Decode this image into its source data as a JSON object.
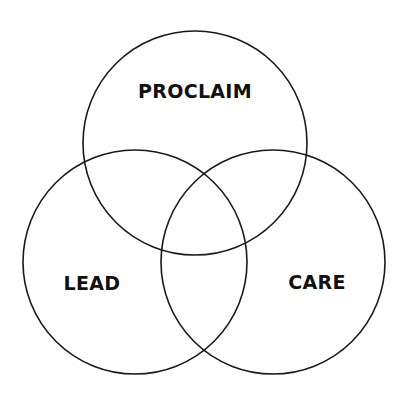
{
  "diagram": {
    "type": "venn",
    "sets": [
      {
        "id": "proclaim",
        "label": "PROCLAIM"
      },
      {
        "id": "lead",
        "label": "LEAD"
      },
      {
        "id": "care",
        "label": "CARE"
      }
    ],
    "stroke_color": "#1a1a1a",
    "text_color": "#111111",
    "background": "#ffffff"
  }
}
